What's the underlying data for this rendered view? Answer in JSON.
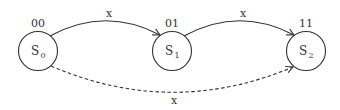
{
  "diagram": {
    "type": "state-transition",
    "states": [
      {
        "id": "S0",
        "name": "S",
        "subscript": "0",
        "code": "00",
        "cx": 38,
        "cy": 51
      },
      {
        "id": "S1",
        "name": "S",
        "subscript": "1",
        "code": "01",
        "cx": 172,
        "cy": 51
      },
      {
        "id": "S2",
        "name": "S",
        "subscript": "2",
        "code": "11",
        "cx": 306,
        "cy": 51
      }
    ],
    "transitions": [
      {
        "from": "S0",
        "to": "S1",
        "label": "x",
        "style": "solid"
      },
      {
        "from": "S1",
        "to": "S2",
        "label": "x",
        "style": "solid"
      },
      {
        "from": "S0",
        "to": "S2",
        "label": "x",
        "style": "dashed"
      }
    ],
    "colors": {
      "stroke": "#333333",
      "background": "#ffffff"
    }
  }
}
